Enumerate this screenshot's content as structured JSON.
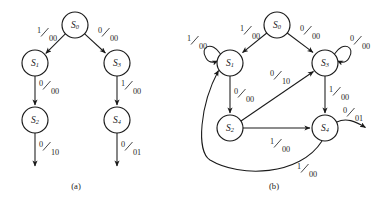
{
  "figure": {
    "panels": [
      {
        "id": "a",
        "caption": "(a)",
        "caption_x": 76,
        "caption_y": 189,
        "nodes": [
          {
            "name": "S0",
            "base": "S",
            "sub": "0",
            "x": 75,
            "y": 25,
            "r": 13
          },
          {
            "name": "S1",
            "base": "S",
            "sub": "1",
            "x": 35,
            "y": 63,
            "r": 13
          },
          {
            "name": "S3",
            "base": "S",
            "sub": "3",
            "x": 117,
            "y": 63,
            "r": 13
          },
          {
            "name": "S2",
            "base": "S",
            "sub": "2",
            "x": 35,
            "y": 120,
            "r": 13
          },
          {
            "name": "S4",
            "base": "S",
            "sub": "4",
            "x": 117,
            "y": 120,
            "r": 13
          }
        ],
        "edges": [
          {
            "from": "S0",
            "to": "S1",
            "input": "1",
            "output": "00",
            "lx": 44,
            "ly": 36
          },
          {
            "from": "S0",
            "to": "S3",
            "input": "0",
            "output": "00",
            "lx": 105,
            "ly": 36
          },
          {
            "from": "S1",
            "to": "S2",
            "input": "0",
            "output": "00",
            "lx": 45,
            "ly": 89
          },
          {
            "from": "S3",
            "to": "S4",
            "input": "1",
            "output": "00",
            "lx": 127,
            "ly": 89
          },
          {
            "from": "S2",
            "to": "out",
            "input": "0",
            "output": "10",
            "lx": 45,
            "ly": 150
          },
          {
            "from": "S4",
            "to": "out",
            "input": "0",
            "output": "01",
            "lx": 127,
            "ly": 150
          }
        ]
      },
      {
        "id": "b",
        "caption": "(b)",
        "caption_x": 274,
        "caption_y": 189,
        "nodes": [
          {
            "name": "S0",
            "base": "S",
            "sub": "0",
            "x": 277,
            "y": 25,
            "r": 13
          },
          {
            "name": "S1",
            "base": "S",
            "sub": "1",
            "x": 230,
            "y": 63,
            "r": 13
          },
          {
            "name": "S3",
            "base": "S",
            "sub": "3",
            "x": 325,
            "y": 63,
            "r": 13
          },
          {
            "name": "S2",
            "base": "S",
            "sub": "2",
            "x": 230,
            "y": 128,
            "r": 13
          },
          {
            "name": "S4",
            "base": "S",
            "sub": "4",
            "x": 325,
            "y": 128,
            "r": 13
          }
        ],
        "edges": [
          {
            "from": "S0",
            "to": "S1",
            "input": "1",
            "output": "00",
            "lx": 246,
            "ly": 33
          },
          {
            "from": "S0",
            "to": "S3",
            "input": "0",
            "output": "00",
            "lx": 308,
            "ly": 33
          },
          {
            "from": "S1",
            "to": "S1",
            "input": "1",
            "output": "00",
            "lx": 194,
            "ly": 43,
            "self_loop": true
          },
          {
            "from": "S3",
            "to": "S3",
            "input": "0",
            "output": "00",
            "lx": 360,
            "ly": 43,
            "self_loop": true
          },
          {
            "from": "S1",
            "to": "S2",
            "input": "0",
            "output": "00",
            "lx": 240,
            "ly": 97
          },
          {
            "from": "S2",
            "to": "S3",
            "input": "0",
            "output": "10",
            "lx": 278,
            "ly": 79
          },
          {
            "from": "S3",
            "to": "S4",
            "input": "1",
            "output": "00",
            "lx": 336,
            "ly": 95
          },
          {
            "from": "S2",
            "to": "S4",
            "input": "1",
            "output": "00",
            "lx": 278,
            "ly": 147
          },
          {
            "from": "S4",
            "to": "out",
            "input": "0",
            "output": "01",
            "lx": 352,
            "ly": 116
          },
          {
            "from": "S4",
            "to": "S1",
            "input": "1",
            "output": "00",
            "lx": 305,
            "ly": 172
          }
        ]
      }
    ]
  },
  "colors": {
    "ink": "#1a1a1a",
    "label_ink": "#262626",
    "background": "#ffffff"
  }
}
